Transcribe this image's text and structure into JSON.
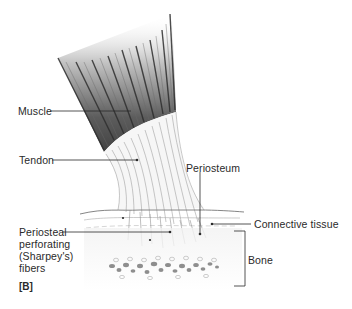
{
  "figure": {
    "panel_tag": "[B]",
    "labels": {
      "muscle": "Muscle",
      "tendon": "Tendon",
      "periosteum": "Periosteum",
      "connective_tissue": "Connective tissue",
      "sharpey_line1": "Periosteal",
      "sharpey_line2": "perforating",
      "sharpey_line3": "(Sharpey's)",
      "sharpey_line4": "fibers",
      "bone": "Bone"
    },
    "colors": {
      "ink": "#2a2a2a",
      "muscle_dark": "#3a3a3a",
      "tendon_fiber": "#9a9a9a",
      "bone_spots": "#6a6a6a",
      "background": "#ffffff"
    }
  }
}
